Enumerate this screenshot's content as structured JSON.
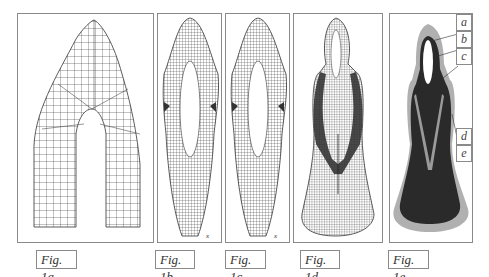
{
  "figure": {
    "panels": [
      {
        "id": "1a",
        "caption": "Fig. 1a",
        "description": "coarse finite-element mesh of tooth-like arch shape"
      },
      {
        "id": "1b",
        "caption": "Fig. 1b",
        "description": "fine mesh, elongated shape with central slot",
        "axis_marker": "x"
      },
      {
        "id": "1c",
        "caption": "Fig. 1c",
        "description": "fine mesh, elongated shape with central slot",
        "axis_marker": "x"
      },
      {
        "id": "1d",
        "caption": "Fig. 1d",
        "description": "dense mesh with dark layered regions, flared base"
      },
      {
        "id": "1e",
        "caption": "Fig. 1e",
        "description": "shaded material regions with labels"
      }
    ],
    "region_labels": [
      "a",
      "b",
      "c",
      "d",
      "e"
    ],
    "colors": {
      "mesh_line": "#333333",
      "dark_region": "#2a2a2a",
      "light_region": "#b0b0b0",
      "mid_region": "#8a8a8a",
      "border": "#8a8a8a"
    }
  }
}
